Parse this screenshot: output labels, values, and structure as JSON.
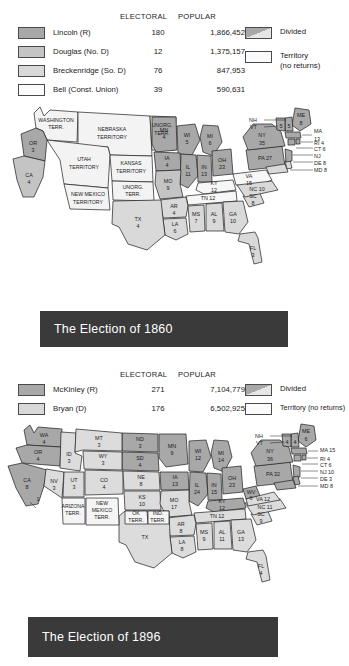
{
  "page": {
    "background": "#ffffff",
    "title_bar_color": "#3a3a3a",
    "title_text_color": "#ffffff"
  },
  "maps": [
    {
      "id": "election-1860",
      "title": "The Election of 1860",
      "legend": {
        "col_electoral": "ELECTORAL",
        "col_popular": "POPULAR",
        "candidates": [
          {
            "swatch": "dark",
            "name": "Lincoln (R)",
            "electoral": "180",
            "popular": "1,866,452",
            "color": "#a8a8a8"
          },
          {
            "swatch": "mid",
            "name": "Douglas (No. D)",
            "electoral": "12",
            "popular": "1,375,157",
            "color": "#c4c4c4"
          },
          {
            "swatch": "light",
            "name": "Breckenridge (So. D)",
            "electoral": "76",
            "popular": "847,953",
            "color": "#d9d9d9"
          },
          {
            "swatch": "white",
            "name": "Bell (Const. Union)",
            "electoral": "39",
            "popular": "590,631",
            "color": "#fbfbfb"
          }
        ],
        "extra": [
          {
            "swatch": "divided",
            "label": "Divided"
          },
          {
            "swatch": "white",
            "label": "Territory",
            "label2": "(no returns)"
          }
        ]
      },
      "states": [
        {
          "abbr": "OR",
          "votes": "3"
        },
        {
          "abbr": "CA",
          "votes": "4"
        },
        {
          "abbr": "MN",
          "votes": "4"
        },
        {
          "abbr": "WI",
          "votes": "5"
        },
        {
          "abbr": "IA",
          "votes": "4"
        },
        {
          "abbr": "MI",
          "votes": "6"
        },
        {
          "abbr": "IL",
          "votes": "11"
        },
        {
          "abbr": "IN",
          "votes": "13"
        },
        {
          "abbr": "OH",
          "votes": "23"
        },
        {
          "abbr": "MO",
          "votes": "9"
        },
        {
          "abbr": "KY",
          "votes": "12"
        },
        {
          "abbr": "TN",
          "votes": "12"
        },
        {
          "abbr": "AR",
          "votes": "4"
        },
        {
          "abbr": "LA",
          "votes": "6"
        },
        {
          "abbr": "TX",
          "votes": "4"
        },
        {
          "abbr": "MS",
          "votes": "7"
        },
        {
          "abbr": "AL",
          "votes": "9"
        },
        {
          "abbr": "GA",
          "votes": "10"
        },
        {
          "abbr": "FL",
          "votes": "3"
        },
        {
          "abbr": "SC",
          "votes": "8"
        },
        {
          "abbr": "NC",
          "votes": "10"
        },
        {
          "abbr": "VA",
          "votes": "15"
        },
        {
          "abbr": "PA",
          "votes": "27"
        },
        {
          "abbr": "NY",
          "votes": "35"
        },
        {
          "abbr": "ME",
          "votes": "8"
        },
        {
          "abbr": "NH",
          "votes": "5"
        },
        {
          "abbr": "VT",
          "votes": "5"
        },
        {
          "abbr": "MA",
          "votes": "13"
        },
        {
          "abbr": "RI",
          "votes": "4"
        },
        {
          "abbr": "CT",
          "votes": "6"
        },
        {
          "abbr": "NJ",
          "votes": ""
        },
        {
          "abbr": "DE",
          "votes": "8"
        },
        {
          "abbr": "MD",
          "votes": "8"
        }
      ],
      "territories": [
        "WASHINGTON TERR.",
        "NEBRASKA TERRITORY",
        "UNORG. TERR.",
        "UTAH TERRITORY",
        "KANSAS TERRITORY",
        "NEW MEXICO TERRITORY",
        "UNORG. TERR."
      ]
    },
    {
      "id": "election-1896",
      "title": "The Election of 1896",
      "legend": {
        "col_electoral": "ELECTORAL",
        "col_popular": "POPULAR",
        "candidates": [
          {
            "swatch": "dark",
            "name": "McKinley (R)",
            "electoral": "271",
            "popular": "7,104,779",
            "color": "#a8a8a8"
          },
          {
            "swatch": "light",
            "name": "Bryan (D)",
            "electoral": "176",
            "popular": "6,502,925",
            "color": "#d9d9d9"
          }
        ],
        "extra": [
          {
            "swatch": "divided",
            "label": "Divided"
          },
          {
            "swatch": "white",
            "label": "Territory (no returns)"
          }
        ]
      },
      "states": [
        {
          "abbr": "WA",
          "votes": "4"
        },
        {
          "abbr": "OR",
          "votes": "4"
        },
        {
          "abbr": "CA",
          "votes": "8"
        },
        {
          "abbr": "CA-split",
          "votes": "1"
        },
        {
          "abbr": "NV",
          "votes": "3"
        },
        {
          "abbr": "ID",
          "votes": "3"
        },
        {
          "abbr": "MT",
          "votes": "3"
        },
        {
          "abbr": "WY",
          "votes": "3"
        },
        {
          "abbr": "UT",
          "votes": "3"
        },
        {
          "abbr": "CO",
          "votes": "4"
        },
        {
          "abbr": "ND",
          "votes": "3"
        },
        {
          "abbr": "SD",
          "votes": "4"
        },
        {
          "abbr": "NE",
          "votes": "8"
        },
        {
          "abbr": "KS",
          "votes": "10"
        },
        {
          "abbr": "MN",
          "votes": "9"
        },
        {
          "abbr": "IA",
          "votes": "13"
        },
        {
          "abbr": "MO",
          "votes": "17"
        },
        {
          "abbr": "WI",
          "votes": "12"
        },
        {
          "abbr": "MI",
          "votes": "14"
        },
        {
          "abbr": "IL",
          "votes": "24"
        },
        {
          "abbr": "IN",
          "votes": "15"
        },
        {
          "abbr": "OH",
          "votes": "23"
        },
        {
          "abbr": "KY",
          "votes": "12"
        },
        {
          "abbr": "TN",
          "votes": "12"
        },
        {
          "abbr": "AR",
          "votes": "8"
        },
        {
          "abbr": "LA",
          "votes": "8"
        },
        {
          "abbr": "TX",
          "votes": ""
        },
        {
          "abbr": "MS",
          "votes": "9"
        },
        {
          "abbr": "AL",
          "votes": "11"
        },
        {
          "abbr": "GA",
          "votes": "13"
        },
        {
          "abbr": "FL",
          "votes": "4"
        },
        {
          "abbr": "SC",
          "votes": "9"
        },
        {
          "abbr": "NC",
          "votes": "11"
        },
        {
          "abbr": "VA",
          "votes": "12"
        },
        {
          "abbr": "WV",
          "votes": "6"
        },
        {
          "abbr": "PA",
          "votes": "32"
        },
        {
          "abbr": "NY",
          "votes": "36"
        },
        {
          "abbr": "ME",
          "votes": "6"
        },
        {
          "abbr": "NH",
          "votes": "4"
        },
        {
          "abbr": "VT",
          "votes": "4"
        },
        {
          "abbr": "MA",
          "votes": "15"
        },
        {
          "abbr": "RI",
          "votes": "4"
        },
        {
          "abbr": "CT",
          "votes": "6"
        },
        {
          "abbr": "NJ",
          "votes": "10"
        },
        {
          "abbr": "DE",
          "votes": "3"
        },
        {
          "abbr": "MD",
          "votes": "8"
        }
      ],
      "territories": [
        "ARIZONA TERR.",
        "NEW MEXICO TERR.",
        "OK TERR.",
        "IND. TERR."
      ]
    }
  ]
}
